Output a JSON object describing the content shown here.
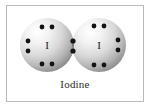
{
  "figure": {
    "caption": "Iodine",
    "frame_color": "#b9b9b9",
    "background_color": "#ffffff"
  },
  "diagram": {
    "type": "lewis-dot-structure",
    "molecule": "Iodine",
    "formula": "I2",
    "bond_type": "single covalent bond",
    "shared_pairs": 1,
    "atoms": [
      {
        "symbol": "I",
        "label": "I",
        "center_x": 47,
        "center_y": 45,
        "radius": 27,
        "lone_pairs": 3,
        "dots": [
          {
            "x": 42,
            "y": 27,
            "name": "electron-dot"
          },
          {
            "x": 52,
            "y": 27,
            "name": "electron-dot"
          },
          {
            "x": 28,
            "y": 41,
            "name": "electron-dot"
          },
          {
            "x": 28,
            "y": 51,
            "name": "electron-dot"
          },
          {
            "x": 42,
            "y": 64,
            "name": "electron-dot"
          },
          {
            "x": 52,
            "y": 64,
            "name": "electron-dot"
          }
        ]
      },
      {
        "symbol": "I",
        "label": "I",
        "center_x": 99,
        "center_y": 45,
        "radius": 27,
        "lone_pairs": 3,
        "dots": [
          {
            "x": 94,
            "y": 26,
            "name": "electron-dot"
          },
          {
            "x": 104,
            "y": 26,
            "name": "electron-dot"
          },
          {
            "x": 118,
            "y": 40,
            "name": "electron-dot"
          },
          {
            "x": 118,
            "y": 50,
            "name": "electron-dot"
          },
          {
            "x": 94,
            "y": 65,
            "name": "electron-dot"
          },
          {
            "x": 104,
            "y": 65,
            "name": "electron-dot"
          }
        ]
      }
    ],
    "shared_dots": [
      {
        "x": 73,
        "y": 41,
        "name": "shared-electron-dot"
      },
      {
        "x": 73,
        "y": 51,
        "name": "shared-electron-dot"
      }
    ],
    "colors": {
      "sphere_light": "#ffffff",
      "sphere_mid": "#d2d2d2",
      "sphere_edge": "#8e8e8e",
      "overlap_fill": "#6e6e6e",
      "dot_color": "#141414",
      "symbol_color": "#1a1a1a"
    }
  }
}
